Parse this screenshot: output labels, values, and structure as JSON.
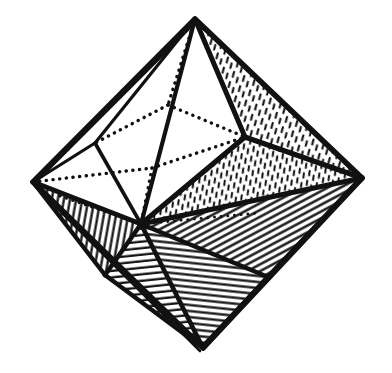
{
  "figure": {
    "caption": "",
    "background_color": "#ffffff",
    "ink_color": "#111111",
    "style": "pen-and-ink line engraving",
    "canvas": {
      "width": 392,
      "height": 373
    }
  },
  "geometry": {
    "description": "Octahedral crystal drawn in oblique projection with visible front faces shaded by hatching and rear edges drawn as dotted hidden lines.",
    "vertices": {
      "top": {
        "name": "top-apex",
        "x": 195,
        "y": 19
      },
      "bottom": {
        "name": "bottom-apex",
        "x": 203,
        "y": 348
      },
      "left": {
        "name": "left-vertex",
        "x": 33,
        "y": 182
      },
      "right": {
        "name": "right-vertex",
        "x": 362,
        "y": 178
      },
      "front": {
        "name": "front-vertex",
        "x": 141,
        "y": 224
      },
      "back": {
        "name": "back-vertex-hidden",
        "x": 168,
        "y": 105
      },
      "upper_right": {
        "name": "upper-right-vertex",
        "x": 245,
        "y": 137
      },
      "mid_left": {
        "name": "mid-left-vertex",
        "x": 95,
        "y": 143
      },
      "lower_left": {
        "name": "lower-left-vertex",
        "x": 105,
        "y": 275
      },
      "lower_right": {
        "name": "lower-right-vertex",
        "x": 268,
        "y": 277
      }
    },
    "faces": [
      {
        "id": "upper-left-face",
        "shading": "none",
        "polygon": "195,19 95,143 33,182"
      },
      {
        "id": "upper-left-inner-face",
        "shading": "none",
        "polygon": "195,19 141,224 95,143"
      },
      {
        "id": "upper-mid-face",
        "shading": "none",
        "polygon": "195,19 245,137 141,224"
      },
      {
        "id": "upper-right-face",
        "shading": "stipple-dash",
        "polygon": "195,19 362,178 245,137"
      },
      {
        "id": "right-mid-face",
        "shading": "stipple-dash",
        "polygon": "245,137 362,178 141,224"
      },
      {
        "id": "lower-right-face",
        "shading": "diagonal-dense",
        "polygon": "141,224 362,178 268,277"
      },
      {
        "id": "bottom-right-face",
        "shading": "horizontal",
        "polygon": "141,224 268,277 203,348"
      },
      {
        "id": "bottom-left-face",
        "shading": "horizontal",
        "polygon": "141,224 203,348 105,275"
      },
      {
        "id": "lower-left-face",
        "shading": "vertical",
        "polygon": "33,182 141,224 105,275"
      }
    ],
    "visible_edges": [
      "top->left",
      "top->front",
      "top->upper_right",
      "top->right",
      "left->front",
      "front->upper_right",
      "upper_right->right",
      "left->lower_left",
      "lower_left->bottom",
      "front->lower_left",
      "front->bottom",
      "front->lower_right",
      "lower_right->bottom",
      "right->lower_right",
      "front->right"
    ],
    "hidden_edges": [
      "left->back",
      "back->top",
      "back->upper_right",
      "back->front",
      "left->right-rear"
    ]
  },
  "hatching": {
    "stipple_dash": {
      "label": "short dashed stipple",
      "angle_deg": 70,
      "density": "medium"
    },
    "diagonal_dense": {
      "label": "dense diagonal lines",
      "angle_deg": 60,
      "density": "high"
    },
    "horizontal": {
      "label": "near-horizontal lines",
      "angle_deg": 8,
      "density": "high"
    },
    "vertical": {
      "label": "near-vertical lines",
      "angle_deg": 80,
      "density": "high"
    }
  }
}
